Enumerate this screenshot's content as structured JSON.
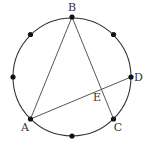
{
  "diagram": {
    "type": "circle-with-inscribed-points",
    "circle": {
      "cx": 72,
      "cy": 77,
      "r": 59,
      "stroke": "#333333"
    },
    "points": [
      {
        "id": "B",
        "label": "B",
        "x": 72,
        "y": 17,
        "lx": 72,
        "ly": 11,
        "anchor": "middle"
      },
      {
        "id": "P1",
        "label": "",
        "x": 113.5,
        "y": 34.5
      },
      {
        "id": "D",
        "label": "D",
        "x": 131,
        "y": 77,
        "lx": 134,
        "ly": 81,
        "anchor": "start"
      },
      {
        "id": "C",
        "label": "C",
        "x": 113.5,
        "y": 119,
        "lx": 118,
        "ly": 131,
        "anchor": "middle"
      },
      {
        "id": "P2",
        "label": "",
        "x": 72,
        "y": 136
      },
      {
        "id": "A",
        "label": "A",
        "x": 30.5,
        "y": 119,
        "lx": 25,
        "ly": 131,
        "anchor": "middle"
      },
      {
        "id": "P3",
        "label": "",
        "x": 13,
        "y": 77
      },
      {
        "id": "P4",
        "label": "",
        "x": 30.5,
        "y": 34.5
      }
    ],
    "segments": [
      {
        "from": "A",
        "to": "B"
      },
      {
        "from": "B",
        "to": "C"
      },
      {
        "from": "A",
        "to": "D"
      }
    ],
    "intersection": {
      "id": "E",
      "label": "E",
      "x": 100,
      "y": 88.5,
      "lx": 97,
      "ly": 101
    }
  }
}
